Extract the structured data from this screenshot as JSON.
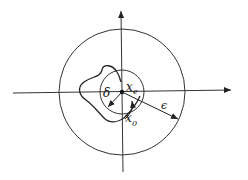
{
  "diagram": {
    "labels": {
      "delta": "δ",
      "equilibrium": "x",
      "equilibrium_sub": "e",
      "epsilon": "ϵ",
      "initial": "x",
      "initial_sub": "0"
    },
    "colors": {
      "stroke": "#222222",
      "background": "#ffffff"
    },
    "geometry": {
      "center": [
        122,
        92
      ],
      "outer_radius_epsilon": 63,
      "inner_radius_delta": 22
    }
  }
}
